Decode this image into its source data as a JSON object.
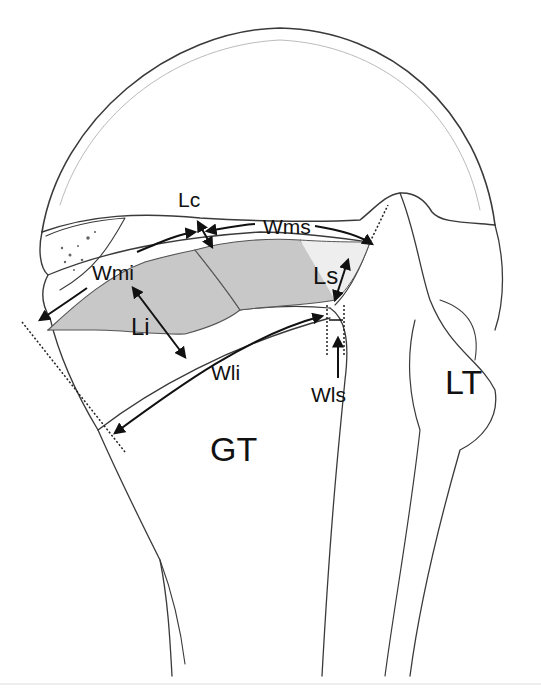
{
  "figure": {
    "colors": {
      "outline": "#3a3a3a",
      "footprint_fill": "#c8c8c8",
      "background": "#ffffff",
      "label": "#111111"
    },
    "labels": {
      "lc": "Lc",
      "wms": "Wms",
      "wmi": "Wmi",
      "ls": "Ls",
      "li": "Li",
      "wli": "Wli",
      "wls": "Wls",
      "gt": "GT",
      "lt": "LT"
    }
  }
}
